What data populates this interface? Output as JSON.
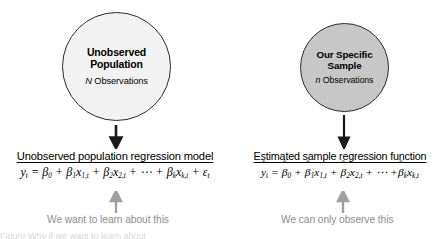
{
  "figure": {
    "population": {
      "circle_title": "Unobserved\nPopulation",
      "circle_subtitle_symbol": "N",
      "circle_subtitle_text": " Observations",
      "heading": "Unobserved population regression model",
      "caption": "We want to learn about this",
      "equation_plain": "y_t = B_0 + B_1 x_1,t + B_2 x_2,t + ... + B_k x_k,t + e_t",
      "circle_fill": "#f2f2f2",
      "circle_border": "#2b2b2b",
      "arrow_down": "down-arrow-black",
      "arrow_up": "up-arrow-gray"
    },
    "sample": {
      "circle_title": "Our Specific\nSample",
      "circle_subtitle_symbol": "n",
      "circle_subtitle_text": " Observations",
      "heading": "Estimated sample regression function",
      "caption": "We can only observe this",
      "equation_plain": "y^_t = B^_0 + B^_1 x_1,t + B^_2 x_2,t + ... + B^_k x_k,t",
      "circle_fill": "#c7c7c7",
      "circle_border": "#2b2b2b",
      "arrow_down": "down-arrow-black",
      "arrow_up": "up-arrow-gray"
    },
    "caption_color": "#8d8d8d",
    "cropped_footer_text": "Figure  Why if we want to learn about"
  }
}
